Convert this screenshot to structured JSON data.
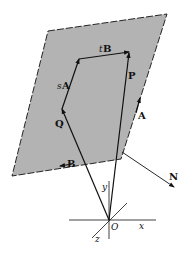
{
  "labels": {
    "sA_s": "s",
    "sA_A": "A",
    "tB_t": "t",
    "tB_B": "B",
    "P": "P",
    "Q": "Q",
    "A": "A",
    "B": "B",
    "N": "N",
    "O": "O",
    "x": "x",
    "y": "y",
    "z": "z"
  },
  "colors": {
    "plane": "#b3b3b3",
    "ink": "#111111"
  }
}
